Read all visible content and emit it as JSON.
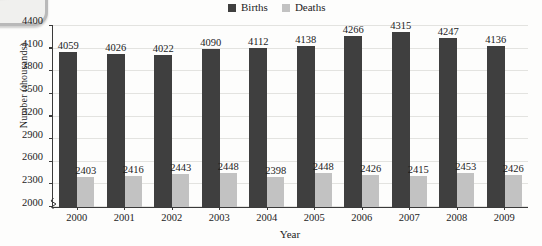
{
  "chart_data": {
    "type": "bar",
    "title": "",
    "xlabel": "Year",
    "ylabel": "Number (thousands)",
    "categories": [
      "2000",
      "2001",
      "2002",
      "2003",
      "2004",
      "2005",
      "2006",
      "2007",
      "2008",
      "2009"
    ],
    "series": [
      {
        "name": "Births",
        "color": "#3f3f3f",
        "values": [
          4059,
          4026,
          4022,
          4090,
          4112,
          4138,
          4266,
          4315,
          4247,
          4136
        ]
      },
      {
        "name": "Deaths",
        "color": "#c2c2c2",
        "values": [
          2403,
          2416,
          2443,
          2448,
          2398,
          2448,
          2426,
          2415,
          2453,
          2426
        ]
      }
    ],
    "ylim": [
      2000,
      4400
    ],
    "yticks": [
      2000,
      2300,
      2600,
      2900,
      3200,
      3500,
      3800,
      4100,
      4400
    ],
    "ytick_labels": [
      "2000",
      "2300",
      "2600",
      "2900",
      "3200",
      "3500",
      "3800",
      "4100",
      "4400"
    ],
    "grid": true,
    "legend_position": "top-center",
    "y_axis_break": true
  }
}
